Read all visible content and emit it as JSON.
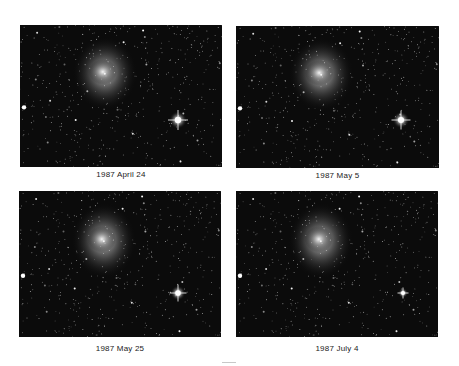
{
  "figure": {
    "panels": [
      {
        "id": "tl",
        "caption": "1987 April 24",
        "box": [
          20,
          25,
          202,
          142
        ],
        "star_brightness": 1.0,
        "star": [
          158,
          95
        ]
      },
      {
        "id": "tr",
        "caption": "1987 May 5",
        "box": [
          236,
          26,
          203,
          142
        ],
        "star_brightness": 0.95,
        "star": [
          165,
          94
        ]
      },
      {
        "id": "bl",
        "caption": "1987 May 25",
        "box": [
          19,
          191,
          202,
          146
        ],
        "star_brightness": 0.85,
        "star": [
          159,
          102
        ]
      },
      {
        "id": "br",
        "caption": "1987 July 4",
        "box": [
          236,
          191,
          202,
          146
        ],
        "star_brightness": 0.55,
        "star": [
          167,
          102
        ]
      }
    ]
  },
  "colors": {
    "background": "#ffffff",
    "sky": "#0b0b0b",
    "star": "#ffffff",
    "caption": "#1a1a1a"
  }
}
